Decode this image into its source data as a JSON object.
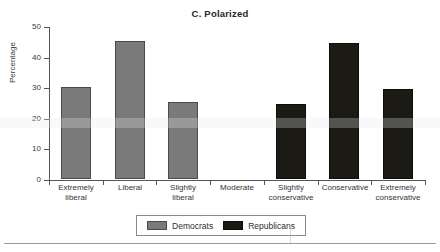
{
  "chart_data": {
    "type": "bar",
    "title": "C. Polarized",
    "xlabel": "",
    "ylabel": "Percentage",
    "ylim": [
      0,
      50
    ],
    "yticks": [
      0,
      10,
      20,
      30,
      40,
      50
    ],
    "grid": false,
    "legend_position": "bottom",
    "categories": [
      "Extremely liberal",
      "Liberal",
      "Slightly liberal",
      "Moderate",
      "Slightly conservative",
      "Conservative",
      "Extremely conservative"
    ],
    "category_lines": [
      [
        "Extremely",
        "liberal"
      ],
      [
        "Liberal",
        ""
      ],
      [
        "Slightly",
        "liberal"
      ],
      [
        "Moderate",
        ""
      ],
      [
        "Slightly",
        "conservative"
      ],
      [
        "Conservative",
        ""
      ],
      [
        "Extremely",
        "conservative"
      ]
    ],
    "series": [
      {
        "name": "Democrats",
        "color": "#7a7a7a",
        "values": [
          30,
          45,
          25,
          0,
          0,
          0,
          0
        ]
      },
      {
        "name": "Republicans",
        "color": "#1c1a14",
        "values": [
          0,
          0,
          0,
          0,
          24.5,
          44.5,
          29.5
        ]
      }
    ]
  },
  "legend": {
    "items": [
      {
        "label": "Democrats",
        "color": "#7a7a7a"
      },
      {
        "label": "Republicans",
        "color": "#1c1a14"
      }
    ]
  },
  "axis": {
    "y_tick_labels": [
      "50",
      "40",
      "30",
      "20",
      "10",
      "0"
    ],
    "y_title": "Percentage"
  }
}
